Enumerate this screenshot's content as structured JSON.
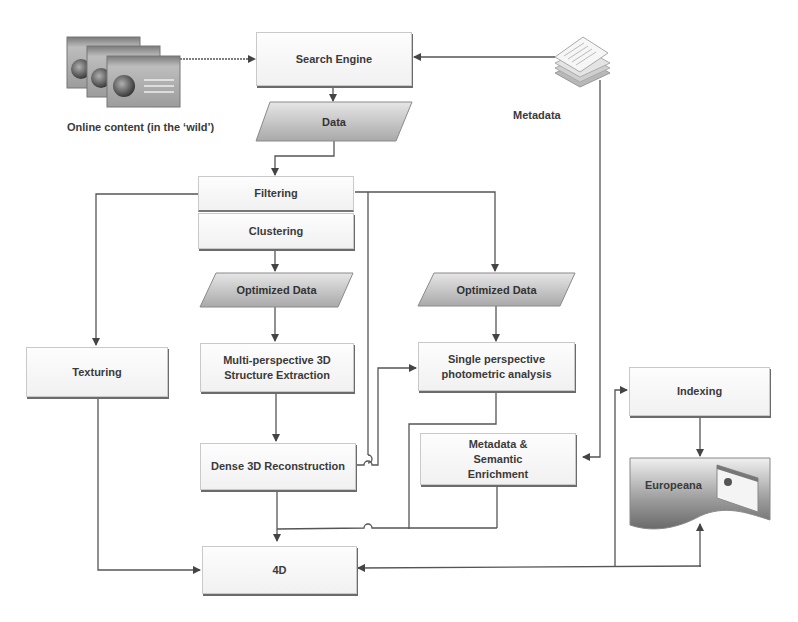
{
  "diagram": {
    "nodes": {
      "online_content": "Online content (in the ‘wild’)",
      "search_engine": "Search Engine",
      "metadata": "Metadata",
      "data": "Data",
      "filtering": "Filtering",
      "clustering": "Clustering",
      "optimized_data_left": "Optimized Data",
      "optimized_data_right": "Optimized Data",
      "texturing": "Texturing",
      "multi_perspective": "Multi-perspective 3D Structure Extraction",
      "single_perspective": "Single perspective photometric analysis",
      "dense_reconstruction": "Dense 3D Reconstruction",
      "metadata_enrichment": "Metadata & Semantic Enrichment",
      "indexing": "Indexing",
      "europeana": "Europeana",
      "four_d": "4D"
    },
    "icons": {
      "online_content": "web-pages-stack-icon",
      "metadata": "document-stack-icon",
      "europeana": "web-page-icon"
    },
    "edges": [
      {
        "from": "online_content",
        "to": "search_engine"
      },
      {
        "from": "metadata",
        "to": "search_engine"
      },
      {
        "from": "metadata",
        "to": "metadata_enrichment"
      },
      {
        "from": "search_engine",
        "to": "data"
      },
      {
        "from": "data",
        "to": "filtering"
      },
      {
        "from": "filtering",
        "to": "texturing"
      },
      {
        "from": "filtering",
        "to": "optimized_data_right"
      },
      {
        "from": "filtering",
        "to": "four_d"
      },
      {
        "from": "clustering",
        "to": "optimized_data_left"
      },
      {
        "from": "optimized_data_left",
        "to": "multi_perspective"
      },
      {
        "from": "optimized_data_right",
        "to": "single_perspective"
      },
      {
        "from": "multi_perspective",
        "to": "dense_reconstruction"
      },
      {
        "from": "dense_reconstruction",
        "to": "single_perspective"
      },
      {
        "from": "dense_reconstruction",
        "to": "four_d"
      },
      {
        "from": "single_perspective",
        "to": "four_d"
      },
      {
        "from": "metadata_enrichment",
        "to": "four_d"
      },
      {
        "from": "texturing",
        "to": "four_d"
      },
      {
        "from": "four_d",
        "to": "indexing"
      },
      {
        "from": "four_d",
        "to": "europeana"
      },
      {
        "from": "indexing",
        "to": "europeana"
      }
    ]
  }
}
